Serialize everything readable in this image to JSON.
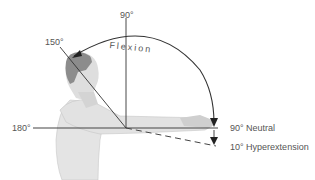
{
  "diagram": {
    "labels": {
      "deg90_top": "90°",
      "deg150": "150°",
      "flexion": "Flexion",
      "deg180": "180°",
      "neutral": "90° Neutral",
      "hyperextension": "10° Hyperextension"
    },
    "colors": {
      "line": "#333333",
      "text": "#555555",
      "skin": "#dcdcdc",
      "hair": "#8a8a8a"
    }
  }
}
